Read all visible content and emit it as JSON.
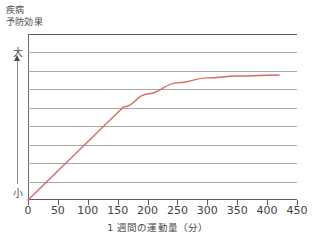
{
  "chart_data": {
    "type": "line",
    "title": "",
    "ylabel": "疾病\n予防効果",
    "ylabel_lines": [
      "疾病",
      "予防効果"
    ],
    "xlabel": "1 週間の運動量（分）",
    "xlim": [
      0,
      450
    ],
    "ylim": [
      0,
      9
    ],
    "grid": true,
    "gridlines_y": [
      1,
      2,
      3,
      4,
      5,
      6,
      7,
      8
    ],
    "legend": "none",
    "y_axis_qualitative": {
      "high_label": "大",
      "low_label": "小",
      "arrow": "upward"
    },
    "xticks": [
      0,
      50,
      100,
      150,
      200,
      250,
      300,
      350,
      400,
      450
    ],
    "xticklabels": [
      "0",
      "50",
      "100",
      "150",
      "200",
      "250",
      "300",
      "350",
      "400",
      "450"
    ],
    "series": [
      {
        "name": "疾病予防効果",
        "color": "#d96a60",
        "x": [
          0,
          160,
          200,
          250,
          300,
          350,
          420
        ],
        "y": [
          0.0,
          5.05,
          5.75,
          6.35,
          6.62,
          6.72,
          6.78
        ]
      }
    ],
    "annotations": {
      "knee_point_x": 160,
      "plateau_from_x": 300,
      "curve_end_x": 420
    }
  },
  "axis": {
    "y_caption_line1": "疾病",
    "y_caption_line2": "予防効果",
    "y_high": "大",
    "y_low": "小",
    "x_caption": "1 週間の運動量（分）"
  },
  "colors": {
    "curve": "#d96a60",
    "grid": "#a9a9a9",
    "frame": "#5d5d5d",
    "text": "#3f3f3f",
    "background": "#ffffff"
  }
}
